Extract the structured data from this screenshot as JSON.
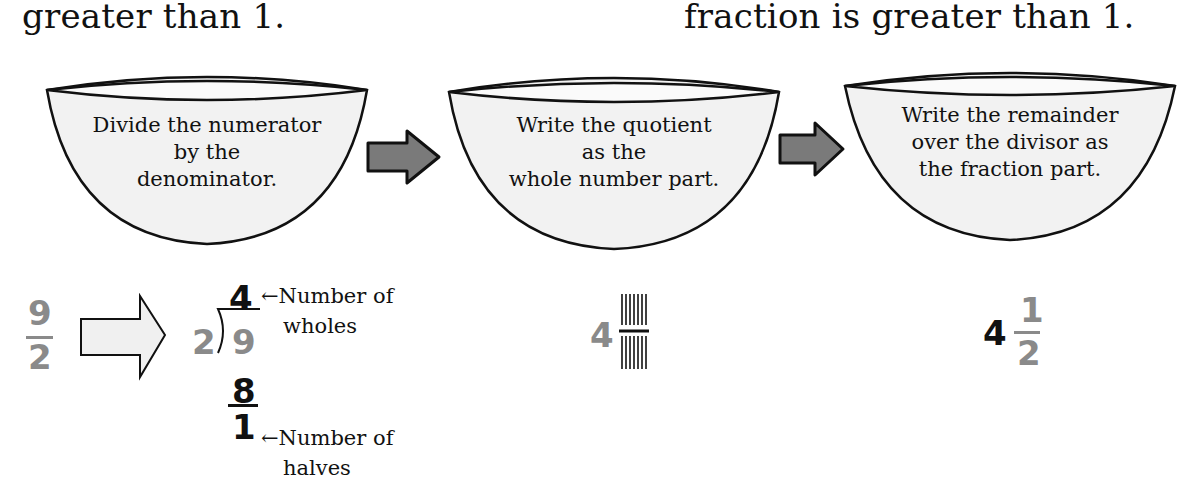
{
  "header": {
    "left_text": "greater than 1.",
    "right_text": "fraction is greater than 1."
  },
  "steps": [
    {
      "lines": [
        "Divide the numerator",
        "by the",
        "denominator."
      ]
    },
    {
      "lines": [
        "Write the quotient",
        "as the",
        "whole number part."
      ]
    },
    {
      "lines": [
        "Write the remainder",
        "over the divisor as",
        "the fraction part."
      ]
    }
  ],
  "connectors": [
    "right-arrow",
    "right-arrow"
  ],
  "example": {
    "improper_fraction": {
      "numerator": "9",
      "denominator": "2"
    },
    "long_division": {
      "divisor": "2",
      "dividend": "9",
      "quotient": "4",
      "product": "8",
      "remainder": "1",
      "quotient_note_line1": "←Number of",
      "quotient_note_line2": "wholes",
      "remainder_note_line1": "←Number of",
      "remainder_note_line2": "halves"
    },
    "partial_mixed": {
      "whole": "4",
      "fraction_placeholder": "blank"
    },
    "mixed_number": {
      "whole": "4",
      "numerator": "1",
      "denominator": "2"
    }
  },
  "colors": {
    "gray_digit": "#8a8a8a",
    "black_digit": "#111111",
    "bowl_fill": "#f2f2f2",
    "arrow_fill": "#7a7a7a",
    "outline_arrow_fill": "#f0f0f0"
  }
}
